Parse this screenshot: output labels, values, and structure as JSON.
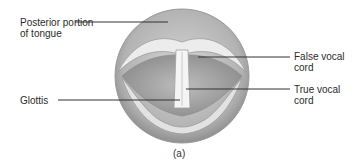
{
  "figure": {
    "caption": "(a)",
    "labels": {
      "posterior_tongue": {
        "line1": "Posterior portion",
        "line2": "of tongue"
      },
      "false_cord": {
        "line1": "False vocal",
        "line2": "cord"
      },
      "true_cord": {
        "line1": "True vocal",
        "line2": "cord"
      },
      "glottis": {
        "line1": "Glottis"
      }
    },
    "colors": {
      "outer": "#b8b8b8",
      "fold": "#e6e6e6",
      "cavity": "#a9a9a9",
      "glottis": "#f4f4f4",
      "leader": "#333333"
    }
  }
}
